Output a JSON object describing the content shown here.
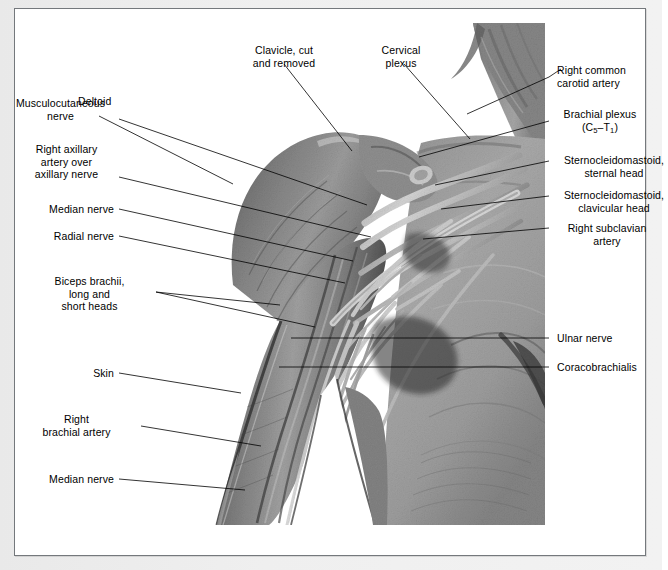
{
  "figure": {
    "kind": "anatomical-dissection-photograph",
    "alt": "Black and white cadaveric dissection photograph of the right shoulder, axilla and upper arm showing the brachial plexus, axillary and brachial arteries and surrounding musculature"
  },
  "labels_left": [
    {
      "id": "musculocutaneous-nerve",
      "lines": [
        "Musculocutaneous",
        "nerve"
      ]
    },
    {
      "id": "right-axillary-artery",
      "lines": [
        "Right axillary",
        "artery over",
        "axillary nerve"
      ]
    },
    {
      "id": "median-nerve-upper",
      "lines": [
        "Median nerve"
      ]
    },
    {
      "id": "radial-nerve",
      "lines": [
        "Radial nerve"
      ]
    },
    {
      "id": "biceps-brachii",
      "lines": [
        "Biceps brachii,",
        "long and",
        "short heads"
      ]
    },
    {
      "id": "skin",
      "lines": [
        "Skin"
      ]
    },
    {
      "id": "right-brachial-artery",
      "lines": [
        "Right",
        "brachial artery"
      ]
    },
    {
      "id": "median-nerve-lower",
      "lines": [
        "Median nerve"
      ]
    }
  ],
  "labels_top": [
    {
      "id": "deltoid",
      "lines": [
        "Deltoid"
      ]
    },
    {
      "id": "clavicle-cut",
      "lines": [
        "Clavicle, cut",
        "and removed"
      ]
    },
    {
      "id": "cervical-plexus",
      "lines": [
        "Cervical",
        "plexus"
      ]
    }
  ],
  "labels_right": [
    {
      "id": "right-common-carotid-artery",
      "lines": [
        "Right common",
        "carotid artery"
      ]
    },
    {
      "id": "brachial-plexus",
      "lines": [
        "Brachial plexus"
      ],
      "sub_line": {
        "prefix": "(C",
        "sub1": "5",
        "mid": "–T",
        "sub2": "1",
        "suffix": ")"
      }
    },
    {
      "id": "sternocleidomastoid-sternal",
      "lines": [
        "Sternocleidomastoid,",
        "sternal head"
      ]
    },
    {
      "id": "sternocleidomastoid-clavicular",
      "lines": [
        "Sternocleidomastoid,",
        "clavicular head"
      ]
    },
    {
      "id": "right-subclavian-artery",
      "lines": [
        "Right subclavian",
        "artery"
      ]
    },
    {
      "id": "ulnar-nerve",
      "lines": [
        "Ulnar nerve"
      ]
    },
    {
      "id": "coracobrachialis",
      "lines": [
        "Coracobrachialis"
      ]
    }
  ],
  "colors": {
    "page": "#ffffff",
    "margin": "#ececec",
    "border": "#74787c",
    "text": "#000000",
    "leader": "#000000"
  }
}
